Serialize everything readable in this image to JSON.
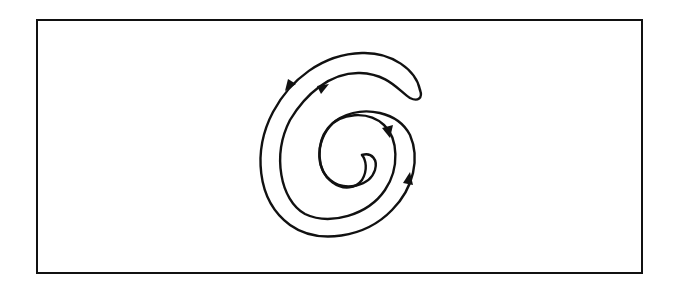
{
  "diagram": {
    "type": "double-spiral closed curve",
    "frame": {
      "left": 36,
      "top": 19,
      "right": 641,
      "bottom": 272
    },
    "colors": {
      "stroke": "#111111",
      "background": "#ffffff"
    },
    "arrows": [
      {
        "id": "outer-top-left",
        "x": 291,
        "y": 85,
        "direction": "down-left"
      },
      {
        "id": "second-top-left",
        "x": 323,
        "y": 88,
        "direction": "up-right"
      },
      {
        "id": "inner-right",
        "x": 388,
        "y": 131,
        "direction": "down"
      },
      {
        "id": "outer-right",
        "x": 408,
        "y": 180,
        "direction": "up"
      }
    ]
  }
}
